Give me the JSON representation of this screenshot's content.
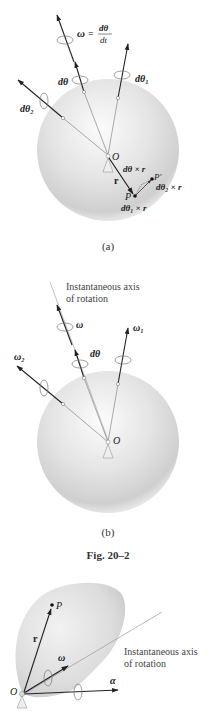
{
  "figure_a": {
    "caption": "(a)",
    "labels": {
      "omega_def_lhs": "ω",
      "omega_def_eq": "=",
      "omega_def_num": "dθ",
      "omega_def_den": "dt",
      "dtheta": "dθ",
      "dtheta1": "dθ₁",
      "dtheta2": "dθ₂",
      "origin": "O",
      "r": "r",
      "point_p": "P",
      "point_p_prime": "P′",
      "dtheta_cross_r": "dθ × r",
      "dtheta1_cross_r": "dθ₁ × r",
      "dtheta2_cross_r": "dθ₂ × r"
    }
  },
  "figure_b": {
    "caption": "(b)",
    "axis_note_line1": "Instantaneous axis",
    "axis_note_line2": "of rotation",
    "labels": {
      "omega": "ω",
      "omega1": "ω₁",
      "omega2": "ω₂",
      "dtheta": "dθ",
      "origin": "O"
    }
  },
  "figure_group_caption": "Fig. 20–2",
  "figure_c": {
    "axis_note_line1": "Instantaneous axis",
    "axis_note_line2": "of rotation",
    "labels": {
      "point_p": "P",
      "r": "r",
      "omega": "ω",
      "alpha": "α",
      "origin": "O"
    }
  }
}
